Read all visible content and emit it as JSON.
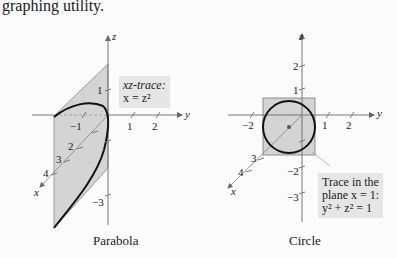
{
  "header_text": "graphing utility.",
  "figures": [
    {
      "caption": "Parabola",
      "annotation": {
        "line1": "xz-trace:",
        "line2": "x = z²"
      },
      "axes": {
        "x": "x",
        "y": "y",
        "z": "z"
      },
      "ticks": {
        "z": [
          "1",
          "−3"
        ],
        "y": [
          "−1",
          "1",
          "2"
        ],
        "x": [
          "2",
          "3",
          "4"
        ]
      }
    },
    {
      "caption": "Circle",
      "annotation": {
        "line1": "Trace in the",
        "line2": "plane x = 1:",
        "line3": "y² + z² = 1"
      },
      "axes": {
        "x": "x",
        "y": "y",
        "z": "z"
      },
      "ticks": {
        "z": [
          "2",
          "1",
          "−2",
          "−3"
        ],
        "y": [
          "−2",
          "1",
          "2"
        ],
        "x": [
          "3",
          "4"
        ]
      }
    }
  ],
  "colors": {
    "fill": "#d4d4d4",
    "curve": "#111111",
    "axis": "#666666",
    "annotation_bg": "#e6e6e6"
  }
}
